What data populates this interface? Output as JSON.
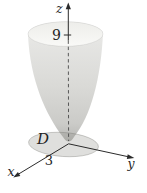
{
  "figure": {
    "kind": "3d-calculus-diagram",
    "labels": {
      "z_axis": "z",
      "y_axis": "y",
      "x_axis": "x",
      "z_tick": "9",
      "x_tick": "3",
      "region": "D"
    },
    "colors": {
      "background": "#ffffff",
      "surface_top": "#ebebe9",
      "surface_mid": "#d9d9d6",
      "surface_low": "#cbcbc8",
      "surface_bottom": "#b6b6b3",
      "interior_shade": "#ededea",
      "interior": "#f9f9f7",
      "disk_fill": "rgba(148,148,144,0.30)",
      "disk_outline": "rgba(110,110,105,0.55)",
      "axis": "#2b2b2b",
      "dashed_axis": "#4a4a4a",
      "text": "#1f1f1f"
    }
  }
}
